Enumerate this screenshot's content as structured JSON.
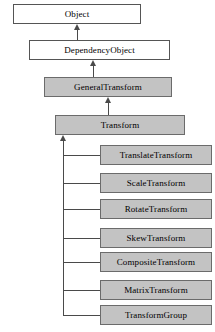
{
  "diagram": {
    "type": "uml-class-inheritance",
    "colors": {
      "background": "#ffffff",
      "node_fill_plain": "#ffffff",
      "node_fill_filled": "#c3c3c3",
      "border": "#4a4a4a",
      "edge": "#4a4a4a",
      "text": "#000000"
    },
    "nodes": [
      {
        "id": "object",
        "label": "Object",
        "style": "plain",
        "x": 13,
        "y": 4,
        "w": 128,
        "h": 20
      },
      {
        "id": "dependency-object",
        "label": "DependencyObject",
        "style": "plain",
        "x": 29,
        "y": 40,
        "w": 141,
        "h": 20
      },
      {
        "id": "general-transform",
        "label": "GeneralTransform",
        "style": "filled",
        "x": 44,
        "y": 77,
        "w": 128,
        "h": 20
      },
      {
        "id": "transform",
        "label": "Transform",
        "style": "filled",
        "x": 55,
        "y": 115,
        "w": 130,
        "h": 20
      },
      {
        "id": "translate-transform",
        "label": "TranslateTransform",
        "style": "filled",
        "x": 100,
        "y": 145,
        "w": 112,
        "h": 20
      },
      {
        "id": "scale-transform",
        "label": "ScaleTransform",
        "style": "filled",
        "x": 100,
        "y": 173,
        "w": 112,
        "h": 20
      },
      {
        "id": "rotate-transform",
        "label": "RotateTransform",
        "style": "filled",
        "x": 100,
        "y": 199,
        "w": 112,
        "h": 20
      },
      {
        "id": "skew-transform",
        "label": "SkewTransform",
        "style": "filled",
        "x": 100,
        "y": 228,
        "w": 112,
        "h": 20
      },
      {
        "id": "composite-transform",
        "label": "CompositeTransform",
        "style": "filled",
        "x": 100,
        "y": 252,
        "w": 112,
        "h": 20
      },
      {
        "id": "matrix-transform",
        "label": "MatrixTransform",
        "style": "filled",
        "x": 100,
        "y": 280,
        "w": 112,
        "h": 20
      },
      {
        "id": "transform-group",
        "label": "TransformGroup",
        "style": "filled",
        "x": 100,
        "y": 305,
        "w": 112,
        "h": 20
      }
    ],
    "edges": [
      {
        "from": "dependency-object",
        "to": "object",
        "kind": "inheritance"
      },
      {
        "from": "general-transform",
        "to": "dependency-object",
        "kind": "inheritance"
      },
      {
        "from": "transform",
        "to": "general-transform",
        "kind": "inheritance"
      },
      {
        "from": "translate-transform",
        "to": "transform",
        "kind": "inheritance"
      },
      {
        "from": "scale-transform",
        "to": "transform",
        "kind": "inheritance"
      },
      {
        "from": "rotate-transform",
        "to": "transform",
        "kind": "inheritance"
      },
      {
        "from": "skew-transform",
        "to": "transform",
        "kind": "inheritance"
      },
      {
        "from": "composite-transform",
        "to": "transform",
        "kind": "inheritance"
      },
      {
        "from": "matrix-transform",
        "to": "transform",
        "kind": "inheritance"
      },
      {
        "from": "transform-group",
        "to": "transform",
        "kind": "inheritance"
      }
    ]
  }
}
